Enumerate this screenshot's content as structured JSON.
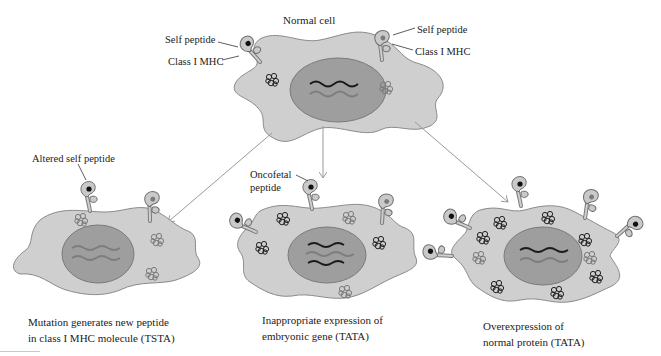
{
  "colors": {
    "cytoplasm": "#cfcfcf",
    "cytoplasm_stroke": "#8a8a8a",
    "nucleus": "#9e9e9e",
    "nucleus_stroke": "#7a7a7a",
    "dark_strand": "#1a1a1a",
    "light_strand": "#7d7d7d",
    "arrow": "#9a9a9a",
    "peptide_self": "#222222",
    "peptide_gray": "#7a7a7a"
  },
  "normal_cell": {
    "title": "Normal cell",
    "label_self_peptide_left": "Self peptide",
    "label_mhc_left": "Class I MHC",
    "label_self_peptide_right": "Self peptide",
    "label_mhc_right": "Class I MHC"
  },
  "cell_tsta": {
    "label_peptide": "Altered self peptide",
    "caption_line1": "Mutation generates new peptide",
    "caption_line2": "in class I MHC molecule (TSTA)"
  },
  "cell_oncofetal": {
    "label_peptide_line1": "Oncofetal",
    "label_peptide_line2": "peptide",
    "caption_line1": "Inappropriate expression of",
    "caption_line2": "embryonic gene (TATA)"
  },
  "cell_overexpression": {
    "caption_line1": "Overexpression of",
    "caption_line2": "normal protein (TATA)"
  },
  "icons": {
    "mhc_molecule": "class-i-mhc-icon",
    "protein": "protein-cluster-icon",
    "dna": "gene-strand-icon",
    "arrow": "arrow-icon"
  }
}
